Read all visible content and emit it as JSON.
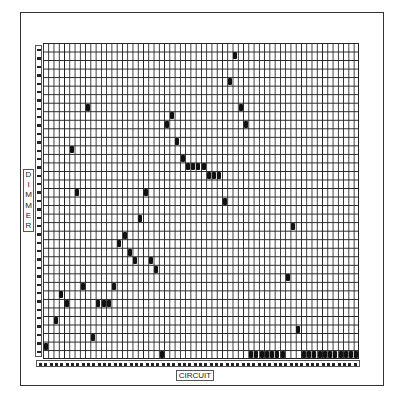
{
  "chart_data": {
    "type": "scatter",
    "title": "",
    "xlabel": "CIRCUIT",
    "ylabel": "DIMMER",
    "grid": true,
    "columns": 60,
    "rows": 37,
    "note": "Patch chart: each filled cell marks a circuit (column, 0-based from left) assigned to a dimmer (row, 0-based from top).",
    "points": [
      {
        "col": 0,
        "row": 35
      },
      {
        "col": 2,
        "row": 32
      },
      {
        "col": 3,
        "row": 29
      },
      {
        "col": 4,
        "row": 30
      },
      {
        "col": 5,
        "row": 12
      },
      {
        "col": 6,
        "row": 17
      },
      {
        "col": 7,
        "row": 28
      },
      {
        "col": 8,
        "row": 7
      },
      {
        "col": 9,
        "row": 34
      },
      {
        "col": 10,
        "row": 30
      },
      {
        "col": 11,
        "row": 30
      },
      {
        "col": 12,
        "row": 30
      },
      {
        "col": 13,
        "row": 28
      },
      {
        "col": 14,
        "row": 23
      },
      {
        "col": 15,
        "row": 22
      },
      {
        "col": 16,
        "row": 24
      },
      {
        "col": 17,
        "row": 25
      },
      {
        "col": 18,
        "row": 20
      },
      {
        "col": 19,
        "row": 17
      },
      {
        "col": 20,
        "row": 25
      },
      {
        "col": 21,
        "row": 26
      },
      {
        "col": 22,
        "row": 36
      },
      {
        "col": 23,
        "row": 9
      },
      {
        "col": 24,
        "row": 8
      },
      {
        "col": 25,
        "row": 11
      },
      {
        "col": 26,
        "row": 13
      },
      {
        "col": 27,
        "row": 14
      },
      {
        "col": 28,
        "row": 14
      },
      {
        "col": 29,
        "row": 14
      },
      {
        "col": 30,
        "row": 14
      },
      {
        "col": 31,
        "row": 15
      },
      {
        "col": 32,
        "row": 15
      },
      {
        "col": 33,
        "row": 15
      },
      {
        "col": 34,
        "row": 18
      },
      {
        "col": 35,
        "row": 4
      },
      {
        "col": 36,
        "row": 1
      },
      {
        "col": 37,
        "row": 7
      },
      {
        "col": 38,
        "row": 9
      },
      {
        "col": 39,
        "row": 36
      },
      {
        "col": 40,
        "row": 36
      },
      {
        "col": 41,
        "row": 36
      },
      {
        "col": 42,
        "row": 36
      },
      {
        "col": 43,
        "row": 36
      },
      {
        "col": 44,
        "row": 36
      },
      {
        "col": 45,
        "row": 36
      },
      {
        "col": 46,
        "row": 27
      },
      {
        "col": 47,
        "row": 21
      },
      {
        "col": 48,
        "row": 33
      },
      {
        "col": 49,
        "row": 36
      },
      {
        "col": 50,
        "row": 36
      },
      {
        "col": 51,
        "row": 36
      },
      {
        "col": 52,
        "row": 36
      },
      {
        "col": 53,
        "row": 36
      },
      {
        "col": 54,
        "row": 36
      },
      {
        "col": 55,
        "row": 36
      },
      {
        "col": 56,
        "row": 36
      },
      {
        "col": 57,
        "row": 36
      },
      {
        "col": 58,
        "row": 36
      },
      {
        "col": 59,
        "row": 36
      }
    ]
  },
  "labels": {
    "dimmer": "DIMMER",
    "circuit": "CIRCUIT"
  }
}
